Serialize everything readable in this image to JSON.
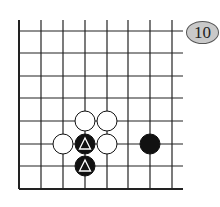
{
  "diagram": {
    "type": "go-board-fragment",
    "badge_label": "10",
    "grid": {
      "x_lines": [
        19,
        41,
        63,
        85,
        107,
        128,
        150,
        172
      ],
      "y_lines": [
        31,
        53,
        76,
        98,
        121,
        144,
        166,
        189
      ],
      "left_edge": true,
      "bottom_edge": true
    },
    "stones": [
      {
        "color": "white",
        "col": 3,
        "row": 4,
        "marker": ""
      },
      {
        "color": "white",
        "col": 4,
        "row": 4,
        "marker": ""
      },
      {
        "color": "white",
        "col": 2,
        "row": 5,
        "marker": ""
      },
      {
        "color": "black",
        "col": 3,
        "row": 5,
        "marker": "triangle"
      },
      {
        "color": "white",
        "col": 4,
        "row": 5,
        "marker": ""
      },
      {
        "color": "black",
        "col": 6,
        "row": 5,
        "marker": ""
      },
      {
        "color": "black",
        "col": 3,
        "row": 6,
        "marker": "triangle"
      }
    ],
    "colors": {
      "black": "#111111",
      "white": "#ffffff",
      "line": "#222222",
      "badge_fill": "#c9c9c9"
    }
  }
}
